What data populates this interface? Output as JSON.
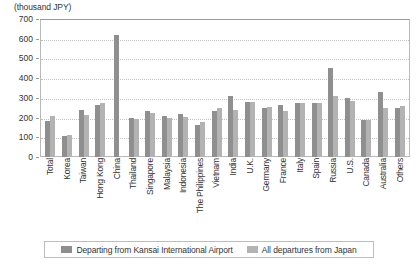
{
  "chart_data": {
    "type": "bar",
    "title": "",
    "subtitle": "",
    "unit_caption": "(thousand JPY)",
    "xlabel": "",
    "ylabel": "",
    "ylim": [
      0,
      700
    ],
    "yticks": [
      0,
      100,
      200,
      300,
      400,
      500,
      600,
      700
    ],
    "ytick_labels": [
      "0",
      "100",
      "200",
      "300",
      "400",
      "500",
      "600",
      "700"
    ],
    "grid": true,
    "legend_position": "bottom",
    "categories": [
      "Total",
      "Korea",
      "Taiwan",
      "Hong Kong",
      "China",
      "Thailand",
      "Singapore",
      "Malaysia",
      "Indonesia",
      "The Philippines",
      "Vietnam",
      "India",
      "U.K.",
      "Germany",
      "France",
      "Italy",
      "Spain",
      "Russia",
      "U.S.",
      "Canada",
      "Australia",
      "Others"
    ],
    "series": [
      {
        "name": "Departing from Kansai International Airport",
        "color": "#8f8f8f",
        "values": [
          183,
          105,
          240,
          263,
          620,
          196,
          232,
          208,
          218,
          160,
          232,
          308,
          278,
          250,
          262,
          275,
          275,
          450,
          300,
          190,
          330,
          248
        ]
      },
      {
        "name": "All departures from Japan",
        "color": "#b3b3b3",
        "values": [
          210,
          110,
          212,
          275,
          null,
          195,
          222,
          200,
          205,
          180,
          250,
          240,
          278,
          255,
          235,
          275,
          275,
          310,
          283,
          190,
          250,
          260
        ]
      }
    ]
  },
  "legend": {
    "items": [
      {
        "label": "Departing from Kansai International Airport",
        "color": "#8f8f8f"
      },
      {
        "label": "All departures from Japan",
        "color": "#b3b3b3"
      }
    ]
  }
}
